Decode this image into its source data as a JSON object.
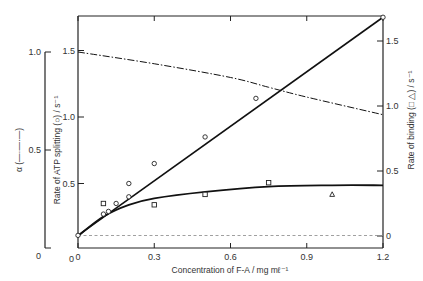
{
  "chart_data": {
    "type": "line",
    "title": "",
    "xlabel": "Concentration of F-A / mg mℓ⁻¹",
    "xlim": [
      0,
      1.2
    ],
    "xticks": [
      {
        "value": 0,
        "label": "0"
      },
      {
        "value": 0.3,
        "label": "0.3"
      },
      {
        "value": 0.6,
        "label": "0.6"
      },
      {
        "value": 0.9,
        "label": "0.9"
      },
      {
        "value": 1.2,
        "label": "1.2"
      }
    ],
    "y_axes": {
      "alpha": {
        "label": "α (—·—·—)",
        "ylim": [
          0,
          1.0
        ],
        "ticks": [
          {
            "value": 0,
            "label": "0"
          },
          {
            "value": 0.5,
            "label": "0.5"
          },
          {
            "value": 1.0,
            "label": "1.0"
          }
        ]
      },
      "left": {
        "label": "Rate of ATP splitting (○) / s⁻¹",
        "ylim": [
          0,
          1.75
        ],
        "ticks": [
          {
            "value": 0,
            "label": "0"
          },
          {
            "value": 0.5,
            "label": "0.5"
          },
          {
            "value": 1.0,
            "label": "1.0"
          },
          {
            "value": 1.5,
            "label": "1.5"
          }
        ]
      },
      "right": {
        "label": "Rate of binding (□ △) / s⁻¹",
        "ylim": [
          -0.1,
          1.69
        ],
        "ticks": [
          {
            "value": 0,
            "label": "0"
          },
          {
            "value": 0.5,
            "label": "0.5"
          },
          {
            "value": 1.0,
            "label": "1.0"
          },
          {
            "value": 1.5,
            "label": "1.5"
          }
        ]
      }
    },
    "series": [
      {
        "name": "ATP splitting (circles)",
        "axis": "left",
        "marker": "circle",
        "line": "solid",
        "points": [
          {
            "x": 0.0,
            "y": 0.11
          },
          {
            "x": 0.1,
            "y": 0.27
          },
          {
            "x": 0.12,
            "y": 0.29
          },
          {
            "x": 0.15,
            "y": 0.35
          },
          {
            "x": 0.2,
            "y": 0.4
          },
          {
            "x": 0.2,
            "y": 0.5
          },
          {
            "x": 0.3,
            "y": 0.65
          },
          {
            "x": 0.5,
            "y": 0.85
          },
          {
            "x": 0.7,
            "y": 1.14
          },
          {
            "x": 1.2,
            "y": 1.75
          }
        ],
        "fit_line": [
          [
            0,
            0.11
          ],
          [
            1.2,
            1.75
          ]
        ]
      },
      {
        "name": "Binding (squares)",
        "axis": "right",
        "marker": "square",
        "line": "solid",
        "points": [
          {
            "x": 0.1,
            "y": 0.25
          },
          {
            "x": 0.3,
            "y": 0.24
          },
          {
            "x": 0.5,
            "y": 0.32
          },
          {
            "x": 0.75,
            "y": 0.41
          }
        ]
      },
      {
        "name": "Binding (triangles)",
        "axis": "right",
        "marker": "triangle",
        "points": [
          {
            "x": 1.0,
            "y": 0.32
          }
        ]
      },
      {
        "name": "Binding fit curve",
        "axis": "right",
        "line": "solid",
        "points_curve": [
          [
            0,
            0.0
          ],
          [
            0.1,
            0.15
          ],
          [
            0.2,
            0.24
          ],
          [
            0.3,
            0.29
          ],
          [
            0.5,
            0.34
          ],
          [
            0.75,
            0.38
          ],
          [
            1.0,
            0.39
          ],
          [
            1.2,
            0.39
          ]
        ]
      },
      {
        "name": "alpha",
        "axis": "alpha",
        "line": "dash-dot",
        "points_curve": [
          [
            0,
            1.0
          ],
          [
            0.3,
            0.94
          ],
          [
            0.6,
            0.87
          ],
          [
            0.75,
            0.82
          ],
          [
            0.9,
            0.77
          ],
          [
            1.2,
            0.68
          ]
        ]
      }
    ],
    "reference_lines": [
      {
        "axis": "right",
        "y": 0,
        "style": "dashed"
      }
    ],
    "grid": false,
    "legend": "none (series identified by marker symbols in axis titles)"
  }
}
